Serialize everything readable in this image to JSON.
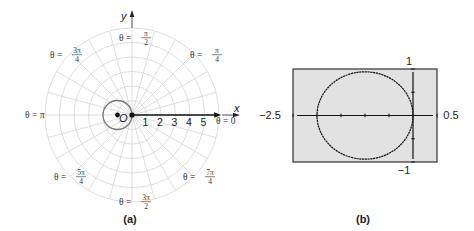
{
  "panel_a": {
    "caption": "(a)",
    "center": {
      "x": 132,
      "y": 115
    },
    "unit_px": 14.5,
    "num_rings": 6,
    "num_spokes": 24,
    "x_axis_label": "x",
    "y_axis_label": "y",
    "origin_label": "O",
    "tick_labels": [
      "1",
      "2",
      "3",
      "4",
      "5"
    ],
    "angle_labels": {
      "zero": {
        "prefix": "θ = 0"
      },
      "pi": {
        "prefix": "θ = π"
      },
      "pi_over_2": {
        "prefix": "θ =",
        "num": "π",
        "den": "2"
      },
      "pi_over_4": {
        "prefix": "θ =",
        "num": "π",
        "den": "4"
      },
      "three_pi_over_4": {
        "prefix": "θ =",
        "num": "3π",
        "den": "4"
      },
      "five_pi_over_4": {
        "prefix": "θ =",
        "num": "5π",
        "den": "4"
      },
      "three_pi_over_2": {
        "prefix": "θ =",
        "num": "3π",
        "den": "2"
      },
      "seven_pi_over_4": {
        "prefix": "θ =",
        "num": "7π",
        "den": "4"
      }
    },
    "curve": {
      "equation": "r = -2cos θ",
      "circle_center_polar_units": [
        -1,
        0
      ],
      "radius_units": 1
    },
    "colors": {
      "grid": "#d4d4d4",
      "curve": "#777777",
      "axis": "#111111"
    }
  },
  "panel_b": {
    "caption": "(b)",
    "window": {
      "xmin": -2.5,
      "xmax": 0.5,
      "ymin": -1,
      "ymax": 1
    },
    "labels": {
      "xmin": "−2.5",
      "xmax": "0.5",
      "ymin": "−1",
      "ymax": "1"
    },
    "screen_color": "#e2e2e2",
    "border_color": "#333333"
  },
  "chart_data": {
    "type": "line",
    "title": "",
    "series": [
      {
        "name": "r = -2cos θ (polar plot, panel a)",
        "shape": "circle",
        "center": [
          -1,
          0
        ],
        "radius": 1
      },
      {
        "name": "graphing calculator plot (panel b)",
        "shape": "circle",
        "center": [
          -1,
          0
        ],
        "radius": 1
      }
    ],
    "panel_a": {
      "grid": "polar",
      "rings": [
        1,
        2,
        3,
        4,
        5,
        6
      ],
      "tick_labels": [
        1,
        2,
        3,
        4,
        5
      ],
      "angle_labels": [
        "θ = 0",
        "θ = π/4",
        "θ = π/2",
        "θ = 3π/4",
        "θ = π",
        "θ = 5π/4",
        "θ = 3π/2",
        "θ = 7π/4"
      ]
    },
    "panel_b": {
      "xlim": [
        -2.5,
        0.5
      ],
      "ylim": [
        -1,
        1
      ],
      "grid": false
    },
    "xlabel": "x",
    "ylabel": "y"
  }
}
